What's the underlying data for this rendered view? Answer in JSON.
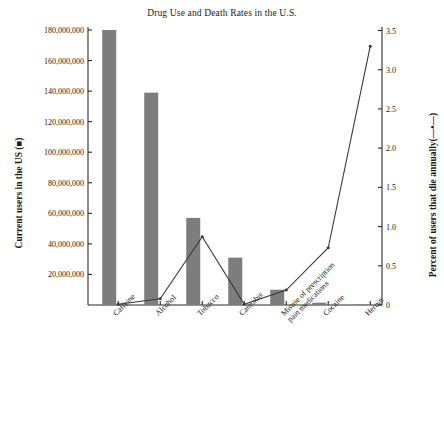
{
  "chart_data": {
    "type": "bar",
    "title": "Drug Use and Death Rates in the U.S.",
    "xlabel": "",
    "ylabel": "Current users in the US (■)",
    "ylabel_right": "Percent of users that die annually(—•—)",
    "categories": [
      "Caffeine",
      "Alcohol",
      "Tobacco",
      "Cannabis",
      "Misuse of prescription\npain medications",
      "Cocaine",
      "Heroin"
    ],
    "grid": false,
    "legend_position": "axis-labels",
    "ylim": [
      0,
      190000000
    ],
    "ylim_right": [
      0,
      3.5
    ],
    "yticks": [
      20000000,
      40000000,
      60000000,
      80000000,
      100000000,
      120000000,
      140000000,
      160000000,
      180000000
    ],
    "ytick_labels": [
      "20,000,000",
      "40,000,000",
      "60,000,000",
      "80,000,000",
      "100,000,000",
      "120,000,000",
      "140,000,000",
      "160,000,000",
      "180,000,000"
    ],
    "yticks_right": [
      0,
      0.5,
      1.0,
      1.5,
      2.0,
      2.5,
      3.0,
      3.5
    ],
    "ytick_labels_right": [
      "0",
      "0.5",
      "1.0",
      "1.5",
      "2.0",
      "2.5",
      "3.0",
      "3.5"
    ],
    "series": [
      {
        "name": "Current users in the US",
        "type": "bar",
        "axis": "left",
        "color": "#7d7d7d",
        "values": [
          180000000,
          139000000,
          57000000,
          31000000,
          10000000,
          1500000,
          400000
        ]
      },
      {
        "name": "Percent of users that die annually",
        "type": "line",
        "axis": "right",
        "color": "#3a3a3a",
        "values": [
          0.01,
          0.08,
          0.87,
          0.01,
          0.19,
          0.73,
          3.3
        ]
      }
    ]
  }
}
